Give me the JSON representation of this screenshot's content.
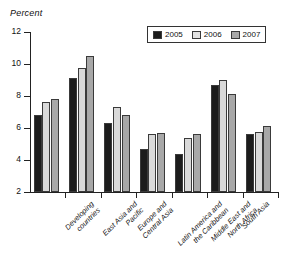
{
  "chart_data": {
    "type": "bar",
    "title": "",
    "subtitle": "",
    "xlabel": "",
    "ylabel": "Percent",
    "ylim": [
      2,
      12
    ],
    "yticks": [
      2,
      4,
      6,
      8,
      10,
      12
    ],
    "ytick_labels": [
      "2",
      "4",
      "6",
      "8",
      "10",
      "12"
    ],
    "grid": false,
    "legend_position": "top-right",
    "categories": [
      "Developing\ncountries",
      "East Asia and\nPacific",
      "Europe and\nCentral Asia",
      "Latin America and\nthe Caribbean",
      "Middle East and\nNorth Africa",
      "South Asia",
      "Sub-Saharan Africa"
    ],
    "series": [
      {
        "name": "2005",
        "color": "#1c1c1c",
        "values": [
          6.8,
          9.1,
          6.3,
          4.7,
          4.4,
          8.7,
          5.65
        ]
      },
      {
        "name": "2006",
        "color": "#d9d9d9",
        "values": [
          7.6,
          9.75,
          7.3,
          5.6,
          5.35,
          9.0,
          5.75
        ]
      },
      {
        "name": "2007",
        "color": "#a8a8a8",
        "values": [
          7.8,
          10.5,
          6.8,
          5.7,
          5.65,
          8.15,
          6.1
        ]
      }
    ]
  },
  "legend": {
    "items": [
      {
        "label": "2005"
      },
      {
        "label": "2006"
      },
      {
        "label": "2007"
      }
    ]
  }
}
